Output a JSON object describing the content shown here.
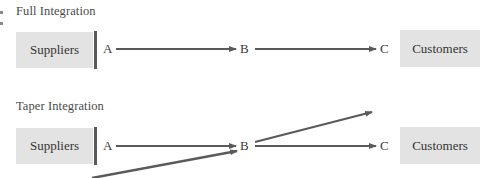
{
  "diagram": {
    "sections": [
      {
        "title": "Full Integration",
        "left_box": "Suppliers",
        "right_box": "Customers",
        "nodes": [
          "A",
          "B",
          "C"
        ]
      },
      {
        "title": "Taper Integration",
        "left_box": "Suppliers",
        "right_box": "Customers",
        "nodes": [
          "A",
          "B",
          "C"
        ]
      }
    ],
    "colors": {
      "box_fill": "#e3e3e3",
      "arrow": "#5a5a5a",
      "bar": "#5a5a5a",
      "text": "#3a3a3a"
    }
  }
}
